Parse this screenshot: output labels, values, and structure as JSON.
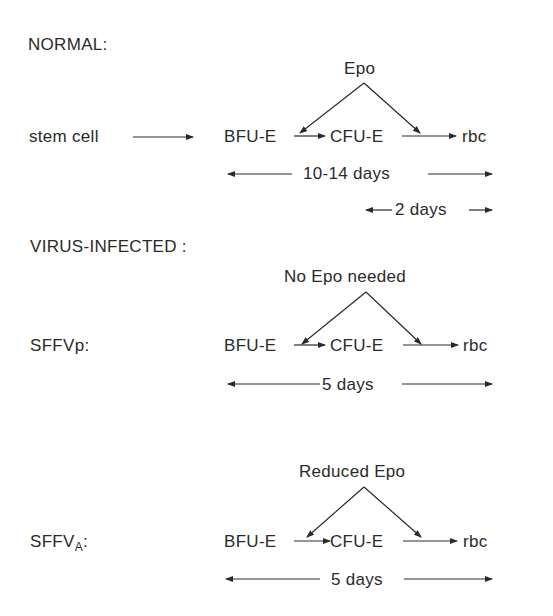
{
  "sections": {
    "normal": {
      "heading": "NORMAL:",
      "source_label": "stem cell",
      "factor_label": "Epo",
      "nodes": [
        "BFU-E",
        "CFU-E",
        "rbc"
      ],
      "durations": [
        "10-14 days",
        "2 days"
      ]
    },
    "virus_infected": {
      "heading": "VIRUS-INFECTED :"
    },
    "sffvp": {
      "strain_label": "SFFVp:",
      "factor_label": "No Epo needed",
      "nodes": [
        "BFU-E",
        "CFU-E",
        "rbc"
      ],
      "durations": [
        "5 days"
      ]
    },
    "sffva": {
      "strain_label": "SFFV",
      "strain_subscript": "A",
      "strain_suffix": ":",
      "factor_label": "Reduced Epo",
      "nodes": [
        "BFU-E",
        "CFU-E",
        "rbc"
      ],
      "durations": [
        "5 days"
      ]
    }
  }
}
